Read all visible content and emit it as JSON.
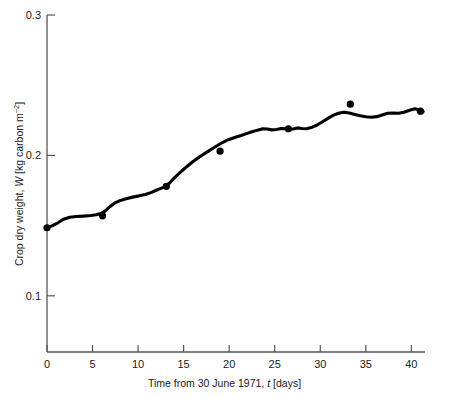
{
  "chart_data": {
    "type": "line",
    "title": "",
    "xlabel": "Time from 30 June 1971, t [days]",
    "ylabel": "Crop dry weight, W [kg carbon m^-2]",
    "xlabel_parts": {
      "pre": "Time from 30 June 1971, ",
      "symbol": "t",
      "post": " [days]"
    },
    "ylabel_parts": {
      "pre": "Crop dry weight, ",
      "symbol": "W",
      "post": " [kg carbon m",
      "exponent": "−2",
      "tail": "]"
    },
    "xlim": [
      0,
      41.5
    ],
    "ylim": [
      0.06,
      0.3
    ],
    "xticks": [
      0,
      5,
      10,
      15,
      20,
      25,
      30,
      35,
      40
    ],
    "xticklabels": [
      "0",
      "5",
      "10",
      "15",
      "20",
      "25",
      "30",
      "35",
      "40"
    ],
    "yticks": [
      0.1,
      0.2,
      0.3
    ],
    "yticklabels": [
      "0.1",
      "0.2",
      "0.3"
    ],
    "grid": false,
    "legend": null,
    "line_color": "#000000",
    "marker_color": "#000000",
    "axis_color": "#555555",
    "series": [
      {
        "name": "simulated crop dry weight",
        "style": "line",
        "x": [
          0.0,
          0.6,
          1.2,
          1.8,
          2.5,
          3.2,
          4.0,
          4.8,
          5.4,
          6.0,
          6.4,
          6.9,
          7.4,
          8.0,
          8.7,
          9.4,
          10.1,
          10.8,
          11.4,
          12.0,
          12.5,
          13.0,
          13.4,
          13.9,
          14.5,
          15.2,
          16.0,
          16.8,
          17.6,
          18.4,
          19.2,
          19.9,
          20.6,
          21.3,
          21.9,
          22.5,
          23.1,
          23.7,
          24.2,
          24.7,
          25.2,
          25.7,
          26.2,
          26.6,
          27.0,
          27.5,
          28.0,
          28.5,
          29.0,
          29.6,
          30.2,
          30.8,
          31.4,
          32.0,
          32.6,
          33.2,
          33.8,
          34.4,
          35.0,
          35.6,
          36.2,
          36.8,
          37.4,
          38.0,
          38.6,
          39.2,
          39.8,
          40.4,
          41.0,
          41.3
        ],
        "y": [
          0.1485,
          0.15,
          0.152,
          0.1545,
          0.156,
          0.1565,
          0.1568,
          0.1572,
          0.1578,
          0.1588,
          0.1605,
          0.1635,
          0.166,
          0.1678,
          0.1692,
          0.1703,
          0.1712,
          0.1722,
          0.1735,
          0.1752,
          0.1765,
          0.1778,
          0.18,
          0.1835,
          0.1872,
          0.1912,
          0.1955,
          0.1992,
          0.2025,
          0.2058,
          0.209,
          0.2112,
          0.2128,
          0.2142,
          0.2155,
          0.2168,
          0.218,
          0.219,
          0.2188,
          0.2182,
          0.2185,
          0.2192,
          0.219,
          0.2186,
          0.2188,
          0.2196,
          0.2192,
          0.219,
          0.2198,
          0.2215,
          0.2238,
          0.2262,
          0.2285,
          0.23,
          0.2308,
          0.2302,
          0.2292,
          0.2282,
          0.2275,
          0.2272,
          0.2276,
          0.2288,
          0.23,
          0.2302,
          0.23,
          0.2308,
          0.2322,
          0.2332,
          0.2322,
          0.2312
        ]
      },
      {
        "name": "measured crop dry weight",
        "style": "markers",
        "x": [
          0.0,
          6.1,
          13.1,
          19.0,
          26.5,
          33.3,
          41.0
        ],
        "y": [
          0.1485,
          0.157,
          0.178,
          0.203,
          0.219,
          0.2365,
          0.2315
        ]
      }
    ]
  }
}
